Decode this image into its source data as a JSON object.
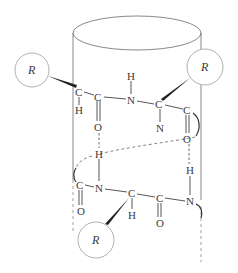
{
  "diagram": {
    "side_chain_label": "R",
    "side_chains": [
      {
        "label": "R",
        "position": "upper-left"
      },
      {
        "label": "R",
        "position": "upper-right"
      },
      {
        "label": "R",
        "position": "lower-middle"
      }
    ],
    "atoms_row1": {
      "c_alpha_1": "C",
      "h_alpha_1": "H",
      "c_carbonyl_1": "C",
      "o_carbonyl_1": "O",
      "n_amide_1": "N",
      "h_amide_1": "H",
      "c_alpha_2": "C",
      "n_alpha_2": "N",
      "c_carbonyl_2": "C",
      "o_carbonyl_2": "O"
    },
    "atoms_row2": {
      "h_amide_lower": "H",
      "c_carbonyl_3": "C",
      "o_carbonyl_3": "O",
      "n_amide_3": "N",
      "c_alpha_3": "C",
      "h_alpha_3": "H",
      "c_carbonyl_4": "C",
      "o_carbonyl_4": "O",
      "n_amide_4": "N",
      "h_amide_4": "H"
    },
    "bonds_note": "dashed lines indicate hydrogen bonds O···H"
  }
}
